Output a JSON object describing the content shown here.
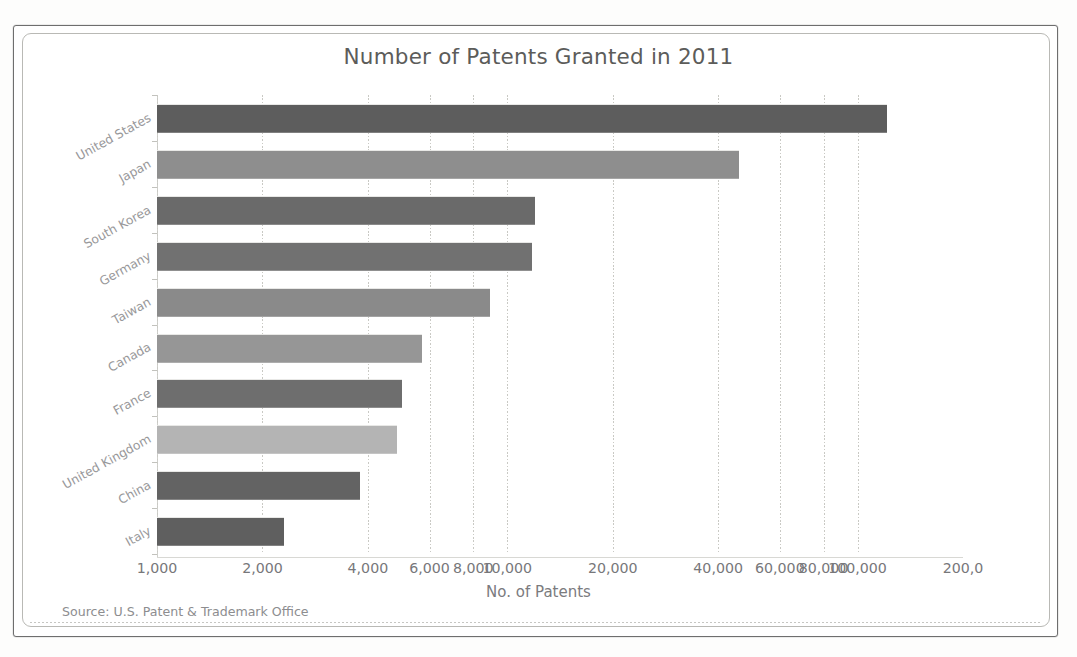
{
  "chart_data": {
    "type": "bar",
    "orientation": "horizontal",
    "title": "Number of Patents Granted in 2011",
    "xlabel": "No. of Patents",
    "ylabel": "",
    "scale": "log",
    "grid": true,
    "legend": false,
    "xlim": [
      1000,
      200000
    ],
    "categories": [
      "United States",
      "Japan",
      "South Korea",
      "Germany",
      "Taiwan",
      "Canada",
      "France",
      "United Kingdom",
      "China",
      "Italy"
    ],
    "values": [
      121000,
      46000,
      12000,
      11800,
      8900,
      5700,
      5000,
      4850,
      3800,
      2300
    ],
    "xticks": [
      "1,000",
      "2,000",
      "4,000",
      "6,000",
      "8,000",
      "10,000",
      "20,000",
      "40,000",
      "60,000",
      "80,000",
      "100,000",
      "200,0"
    ],
    "xtick_values": [
      1000,
      2000,
      4000,
      6000,
      8000,
      10000,
      20000,
      40000,
      60000,
      80000,
      100000,
      200000
    ],
    "bar_colors": [
      "#5d5d5d",
      "#8e8e8e",
      "#6a6a6a",
      "#717171",
      "#8a8a8a",
      "#969696",
      "#6e6e6e",
      "#b4b4b4",
      "#636363",
      "#5f5f5f"
    ],
    "source": "Source: U.S. Patent & Trademark Office"
  },
  "frame": {
    "border_color": "#6e6e6e",
    "inner_border_color": "#b9b9b5"
  }
}
